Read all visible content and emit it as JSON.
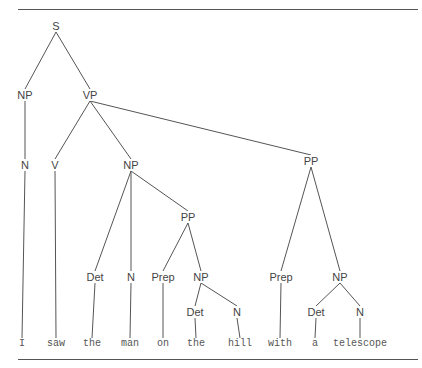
{
  "diagram": {
    "type": "syntax-tree",
    "sentence": "I saw the man on the hill with a telescope",
    "nodes": [
      {
        "id": "S",
        "label": "S",
        "x": 56,
        "y": 26
      },
      {
        "id": "NP1",
        "label": "NP",
        "x": 25,
        "y": 95
      },
      {
        "id": "VP",
        "label": "VP",
        "x": 90,
        "y": 95
      },
      {
        "id": "N1",
        "label": "N",
        "x": 25,
        "y": 165
      },
      {
        "id": "V",
        "label": "V",
        "x": 55,
        "y": 165
      },
      {
        "id": "NP2",
        "label": "NP",
        "x": 131,
        "y": 165
      },
      {
        "id": "PP1",
        "label": "PP",
        "x": 311,
        "y": 161
      },
      {
        "id": "PP2",
        "label": "PP",
        "x": 188,
        "y": 217
      },
      {
        "id": "Det1",
        "label": "Det",
        "x": 95,
        "y": 277
      },
      {
        "id": "N2",
        "label": "N",
        "x": 131,
        "y": 277
      },
      {
        "id": "Prep1",
        "label": "Prep",
        "x": 163,
        "y": 277
      },
      {
        "id": "NP3",
        "label": "NP",
        "x": 201,
        "y": 277
      },
      {
        "id": "Prep2",
        "label": "Prep",
        "x": 281,
        "y": 277
      },
      {
        "id": "NP4",
        "label": "NP",
        "x": 340,
        "y": 277
      },
      {
        "id": "Det2",
        "label": "Det",
        "x": 195,
        "y": 312
      },
      {
        "id": "N3",
        "label": "N",
        "x": 237,
        "y": 312
      },
      {
        "id": "Det3",
        "label": "Det",
        "x": 316,
        "y": 312
      },
      {
        "id": "N4",
        "label": "N",
        "x": 360,
        "y": 312
      }
    ],
    "words": [
      {
        "id": "w1",
        "label": "I",
        "x": 22,
        "y": 344,
        "parent": "N1"
      },
      {
        "id": "w2",
        "label": "saw",
        "x": 56,
        "y": 344,
        "parent": "V"
      },
      {
        "id": "w3",
        "label": "the",
        "x": 92,
        "y": 344,
        "parent": "Det1"
      },
      {
        "id": "w4",
        "label": "man",
        "x": 130,
        "y": 344,
        "parent": "N2"
      },
      {
        "id": "w5",
        "label": "on",
        "x": 163,
        "y": 344,
        "parent": "Prep1"
      },
      {
        "id": "w6",
        "label": "the",
        "x": 196,
        "y": 344,
        "parent": "Det2"
      },
      {
        "id": "w7",
        "label": "hill",
        "x": 240,
        "y": 344,
        "parent": "N3"
      },
      {
        "id": "w8",
        "label": "with",
        "x": 280,
        "y": 344,
        "parent": "Prep2"
      },
      {
        "id": "w9",
        "label": "a",
        "x": 315,
        "y": 344,
        "parent": "Det3"
      },
      {
        "id": "w10",
        "label": "telescope",
        "x": 360,
        "y": 344,
        "parent": "N4"
      }
    ],
    "edges": [
      [
        "S",
        "NP1"
      ],
      [
        "S",
        "VP"
      ],
      [
        "NP1",
        "N1"
      ],
      [
        "VP",
        "V"
      ],
      [
        "VP",
        "NP2"
      ],
      [
        "VP",
        "PP1"
      ],
      [
        "NP2",
        "Det1"
      ],
      [
        "NP2",
        "N2"
      ],
      [
        "NP2",
        "PP2"
      ],
      [
        "PP2",
        "Prep1"
      ],
      [
        "PP2",
        "NP3"
      ],
      [
        "NP3",
        "Det2"
      ],
      [
        "NP3",
        "N3"
      ],
      [
        "PP1",
        "Prep2"
      ],
      [
        "PP1",
        "NP4"
      ],
      [
        "NP4",
        "Det3"
      ],
      [
        "NP4",
        "N4"
      ],
      [
        "N1",
        "w1"
      ],
      [
        "V",
        "w2"
      ],
      [
        "Det1",
        "w3"
      ],
      [
        "N2",
        "w4"
      ],
      [
        "Prep1",
        "w5"
      ],
      [
        "Det2",
        "w6"
      ],
      [
        "N3",
        "w7"
      ],
      [
        "Prep2",
        "w8"
      ],
      [
        "Det3",
        "w9"
      ],
      [
        "N4",
        "w10"
      ]
    ],
    "rules": [
      {
        "x1": 18,
        "x2": 418,
        "y": 9
      },
      {
        "x1": 18,
        "x2": 418,
        "y": 359
      }
    ],
    "colors": {
      "line": "#555555",
      "text": "#444444",
      "background": "#ffffff"
    }
  }
}
